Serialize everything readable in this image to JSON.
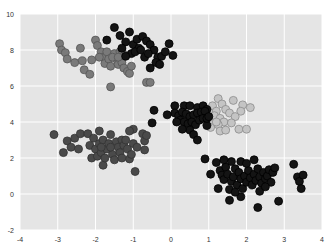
{
  "chart_data": {
    "type": "scatter",
    "title": "",
    "xlabel": "",
    "ylabel": "",
    "xlim": [
      -4,
      4
    ],
    "ylim": [
      -2,
      10
    ],
    "x_ticks": [
      -4,
      -3,
      -2,
      -1,
      0,
      1,
      2,
      3,
      4
    ],
    "y_ticks": [
      -2,
      0,
      2,
      4,
      6,
      8,
      10
    ],
    "grid": true,
    "legend": null,
    "style": {
      "background": "#e5e5e5",
      "grid_color": "#ffffff",
      "marker_size": 4
    },
    "series": [
      {
        "name": "cluster-light",
        "color": "#c4c4c4",
        "edge": "#8c8c8c",
        "points": [
          [
            1.25,
            5.3
          ],
          [
            1.35,
            5.0
          ],
          [
            1.65,
            5.2
          ],
          [
            1.9,
            4.95
          ],
          [
            2.1,
            4.8
          ],
          [
            1.85,
            4.6
          ],
          [
            1.1,
            4.9
          ],
          [
            1.2,
            4.6
          ],
          [
            1.45,
            4.7
          ],
          [
            1.55,
            4.5
          ],
          [
            1.0,
            4.55
          ],
          [
            1.15,
            4.35
          ],
          [
            1.3,
            4.2
          ],
          [
            1.4,
            4.0
          ],
          [
            1.7,
            4.3
          ],
          [
            1.6,
            3.95
          ],
          [
            1.0,
            4.1
          ],
          [
            1.1,
            3.9
          ],
          [
            1.25,
            3.85
          ],
          [
            1.8,
            3.6
          ],
          [
            2.0,
            3.6
          ],
          [
            1.3,
            3.5
          ],
          [
            1.45,
            3.55
          ],
          [
            1.05,
            3.7
          ],
          [
            0.95,
            4.2
          ],
          [
            1.2,
            4.0
          ]
        ]
      },
      {
        "name": "cluster-mid",
        "color": "#7a7a7a",
        "edge": "#555555",
        "points": [
          [
            -2.95,
            8.35
          ],
          [
            -2.9,
            8.0
          ],
          [
            -2.8,
            7.85
          ],
          [
            -2.75,
            7.5
          ],
          [
            -2.55,
            7.3
          ],
          [
            -2.4,
            8.1
          ],
          [
            -2.35,
            7.4
          ],
          [
            -2.3,
            6.9
          ],
          [
            -2.15,
            6.65
          ],
          [
            -2.0,
            8.55
          ],
          [
            -1.95,
            8.25
          ],
          [
            -1.85,
            7.9
          ],
          [
            -1.8,
            7.6
          ],
          [
            -1.75,
            7.25
          ],
          [
            -1.7,
            7.9
          ],
          [
            -1.65,
            7.5
          ],
          [
            -1.6,
            7.1
          ],
          [
            -1.5,
            7.8
          ],
          [
            -1.45,
            7.5
          ],
          [
            -1.4,
            7.2
          ],
          [
            -1.35,
            7.9
          ],
          [
            -1.3,
            7.3
          ],
          [
            -1.25,
            7.0
          ],
          [
            -1.2,
            7.7
          ],
          [
            -1.15,
            6.8
          ],
          [
            -1.1,
            6.7
          ],
          [
            -1.05,
            7.1
          ],
          [
            -1.6,
            5.95
          ],
          [
            -0.65,
            6.2
          ],
          [
            -0.55,
            6.2
          ],
          [
            -1.9,
            7.6
          ],
          [
            -2.1,
            7.45
          ],
          [
            -1.55,
            7.6
          ],
          [
            -1.4,
            7.6
          ],
          [
            -1.3,
            8.0
          ]
        ]
      },
      {
        "name": "cluster-dark",
        "color": "#4a4a4a",
        "edge": "#333333",
        "points": [
          [
            -3.1,
            3.3
          ],
          [
            -2.85,
            2.3
          ],
          [
            -2.75,
            2.95
          ],
          [
            -2.65,
            2.6
          ],
          [
            -2.55,
            3.1
          ],
          [
            -2.4,
            3.35
          ],
          [
            -2.2,
            3.35
          ],
          [
            -2.15,
            2.7
          ],
          [
            -2.1,
            2.0
          ],
          [
            -2.05,
            3.1
          ],
          [
            -2.0,
            2.5
          ],
          [
            -1.95,
            2.1
          ],
          [
            -1.9,
            2.8
          ],
          [
            -1.85,
            2.3
          ],
          [
            -1.8,
            3.0
          ],
          [
            -1.8,
            1.6
          ],
          [
            -1.75,
            2.0
          ],
          [
            -1.7,
            2.5
          ],
          [
            -1.65,
            2.8
          ],
          [
            -1.6,
            3.3
          ],
          [
            -1.55,
            2.2
          ],
          [
            -1.5,
            1.9
          ],
          [
            -1.45,
            2.9
          ],
          [
            -1.4,
            2.6
          ],
          [
            -1.35,
            2.3
          ],
          [
            -1.3,
            3.0
          ],
          [
            -1.25,
            2.7
          ],
          [
            -1.2,
            3.0
          ],
          [
            -1.15,
            2.5
          ],
          [
            -1.1,
            1.95
          ],
          [
            -1.05,
            2.2
          ],
          [
            -1.0,
            3.6
          ],
          [
            -1.0,
            2.8
          ],
          [
            -0.95,
            1.25
          ],
          [
            -0.9,
            2.6
          ],
          [
            -0.75,
            3.35
          ],
          [
            -0.7,
            2.95
          ],
          [
            -0.65,
            3.25
          ],
          [
            -0.7,
            2.45
          ],
          [
            -1.1,
            3.5
          ],
          [
            -1.9,
            3.5
          ],
          [
            -2.45,
            2.5
          ],
          [
            -1.6,
            2.6
          ],
          [
            -1.85,
            2.6
          ],
          [
            -1.3,
            2.0
          ]
        ]
      },
      {
        "name": "cluster-black",
        "color": "#141414",
        "edge": "#000000",
        "points": [
          [
            -1.5,
            9.25
          ],
          [
            -1.7,
            8.55
          ],
          [
            -1.35,
            8.8
          ],
          [
            -1.2,
            8.45
          ],
          [
            -1.1,
            9.0
          ],
          [
            -1.0,
            8.3
          ],
          [
            -0.9,
            8.6
          ],
          [
            -0.85,
            8.1
          ],
          [
            -0.75,
            8.75
          ],
          [
            -0.65,
            8.5
          ],
          [
            -0.55,
            8.3
          ],
          [
            -0.45,
            8.0
          ],
          [
            -0.35,
            7.6
          ],
          [
            -0.25,
            7.65
          ],
          [
            -0.15,
            7.9
          ],
          [
            -1.3,
            8.1
          ],
          [
            -1.05,
            7.8
          ],
          [
            -0.95,
            7.9
          ],
          [
            -0.8,
            8.0
          ],
          [
            -0.7,
            7.6
          ],
          [
            -0.6,
            7.8
          ],
          [
            -0.4,
            7.3
          ],
          [
            -0.55,
            7.0
          ],
          [
            -0.3,
            7.2
          ],
          [
            0.05,
            7.7
          ],
          [
            -0.05,
            8.35
          ],
          [
            -1.2,
            7.65
          ],
          [
            -0.45,
            4.65
          ],
          [
            -0.5,
            3.95
          ],
          [
            0.1,
            4.9
          ],
          [
            0.35,
            4.9
          ],
          [
            0.5,
            4.9
          ],
          [
            0.7,
            4.8
          ],
          [
            0.85,
            4.9
          ],
          [
            0.95,
            4.7
          ],
          [
            0.1,
            4.5
          ],
          [
            0.2,
            4.35
          ],
          [
            0.3,
            4.55
          ],
          [
            0.4,
            4.45
          ],
          [
            0.5,
            4.3
          ],
          [
            0.6,
            4.4
          ],
          [
            0.7,
            4.5
          ],
          [
            0.8,
            4.55
          ],
          [
            0.9,
            4.6
          ],
          [
            0.25,
            4.1
          ],
          [
            0.35,
            4.0
          ],
          [
            0.45,
            3.9
          ],
          [
            0.55,
            4.0
          ],
          [
            0.65,
            3.85
          ],
          [
            0.75,
            4.1
          ],
          [
            0.85,
            4.2
          ],
          [
            0.95,
            3.8
          ],
          [
            0.5,
            3.55
          ],
          [
            0.6,
            3.3
          ],
          [
            0.7,
            3.0
          ],
          [
            0.3,
            3.6
          ],
          [
            -0.1,
            4.4
          ],
          [
            0.15,
            4.0
          ],
          [
            0.95,
            4.2
          ],
          [
            1.0,
            4.3
          ],
          [
            0.9,
            1.95
          ],
          [
            1.05,
            1.1
          ],
          [
            1.2,
            1.75
          ],
          [
            1.25,
            0.3
          ],
          [
            1.3,
            1.3
          ],
          [
            1.35,
            1.05
          ],
          [
            1.4,
            0.8
          ],
          [
            1.45,
            1.5
          ],
          [
            1.5,
            1.1
          ],
          [
            1.55,
            0.25
          ],
          [
            1.6,
            0.7
          ],
          [
            1.65,
            0.95
          ],
          [
            1.7,
            1.4
          ],
          [
            1.75,
            0.5
          ],
          [
            1.8,
            1.2
          ],
          [
            1.85,
            0.85
          ],
          [
            1.85,
            1.8
          ],
          [
            1.9,
            0.3
          ],
          [
            1.95,
            1.0
          ],
          [
            2.0,
            0.65
          ],
          [
            2.05,
            1.3
          ],
          [
            2.1,
            0.9
          ],
          [
            2.15,
            0.5
          ],
          [
            2.2,
            1.1
          ],
          [
            2.25,
            0.75
          ],
          [
            2.3,
            1.4
          ],
          [
            2.35,
            0.95
          ],
          [
            2.4,
            0.6
          ],
          [
            2.45,
            1.2
          ],
          [
            2.5,
            0.85
          ],
          [
            2.55,
            1.0
          ],
          [
            2.6,
            1.35
          ],
          [
            2.65,
            0.65
          ],
          [
            2.7,
            1.2
          ],
          [
            2.75,
            1.45
          ],
          [
            1.55,
            -0.35
          ],
          [
            1.85,
            -0.15
          ],
          [
            2.3,
            -0.75
          ],
          [
            2.85,
            -0.4
          ],
          [
            3.25,
            1.65
          ],
          [
            3.35,
            0.95
          ],
          [
            3.4,
            0.7
          ],
          [
            3.45,
            0.3
          ],
          [
            3.5,
            1.05
          ],
          [
            2.35,
            0.15
          ],
          [
            1.6,
            1.8
          ],
          [
            2.0,
            1.7
          ],
          [
            2.2,
            1.9
          ],
          [
            1.4,
            1.9
          ],
          [
            1.7,
            0.1
          ],
          [
            2.5,
            0.4
          ]
        ]
      }
    ]
  },
  "plot_area": {
    "left": 20,
    "top": 14,
    "right": 322,
    "bottom": 230
  }
}
